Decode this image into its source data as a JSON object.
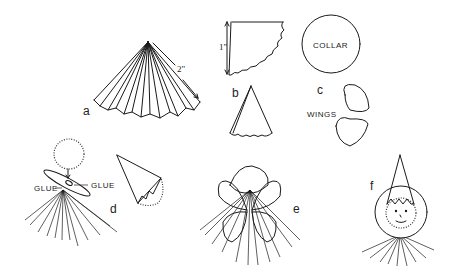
{
  "figure": {
    "panels": [
      {
        "id": "a",
        "label": "a",
        "dimension": "2\"",
        "description": "pleated fan cone"
      },
      {
        "id": "b",
        "label": "b",
        "dimension": "1\"",
        "description": "scalloped quarter-circle pattern and rolled hat cone"
      },
      {
        "id": "c",
        "label": "c",
        "collar_label": "COLLAR",
        "wings_label": "WINGS",
        "description": "collar circle and two wing shapes"
      },
      {
        "id": "d",
        "label": "d",
        "glue_left": "GLUE",
        "glue_right": "GLUE",
        "description": "head ball glued on collar over fan; hat cone with pompom"
      },
      {
        "id": "e",
        "label": "e",
        "description": "wings attached over fan"
      },
      {
        "id": "f",
        "label": "f",
        "description": "finished figure with hat and face"
      }
    ]
  },
  "colors": {
    "ink": "#1a1a1a",
    "background": "#ffffff"
  }
}
